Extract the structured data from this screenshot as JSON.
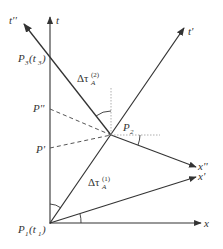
{
  "diagram": {
    "type": "spacetime-diagram",
    "axes": {
      "t": "t",
      "x": "x",
      "t_prime": "t'",
      "x_prime": "x'",
      "t_double_prime": "t''",
      "x_double_prime": "x''"
    },
    "points": {
      "p1_main": "P",
      "p1_sub": "1",
      "p1_arg": "(t",
      "p1_arg_sub": "1",
      "p1_close": ")",
      "p3_main": "P",
      "p3_sub": "3",
      "p3_arg": "(t",
      "p3_arg_sub": "3",
      "p3_close": ")",
      "p2_main": "P",
      "p2_sub": "2",
      "p_double_prime": "P''",
      "p_prime": "P'"
    },
    "intervals": {
      "tau2_delta": "Δτ",
      "tau2_sub": "A",
      "tau2_sup": "(2)",
      "tau1_delta": "Δτ",
      "tau1_sub": "A",
      "tau1_sup": "(1)"
    },
    "colors": {
      "line": "#333333",
      "dashed": "#555555",
      "dotted": "#999999"
    }
  }
}
